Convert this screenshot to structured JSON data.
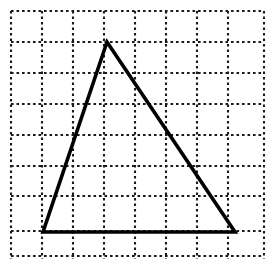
{
  "figure": {
    "title": "Triangle drawn on a dotted square grid",
    "background_color": "#ffffff",
    "width": 273,
    "height": 276
  },
  "chart_data": {
    "type": "scatter",
    "title": "Triangle drawn on a dotted square grid",
    "subtitle": "",
    "xlabel": "",
    "ylabel": "",
    "grid": true,
    "grid_style": "dotted",
    "legend": "none",
    "xlim": [
      0,
      8
    ],
    "ylim": [
      0,
      8
    ],
    "x_tick_labels": [],
    "y_tick_labels": [],
    "grid_columns": 8,
    "grid_rows": 8,
    "cell_width_px": 31,
    "cell_height_px": 30.7,
    "grid_origin_px": [
      11,
      11
    ],
    "grid_line_color": "#1a1a1a",
    "grid_dash_pattern": "2.6 2.9",
    "shape_color": "#000000",
    "shape_stroke_width_px": 3.6,
    "shapes": [
      {
        "name": "triangle",
        "closed": true,
        "vertices_grid": [
          {
            "label": "apex",
            "x": 3.1,
            "y": 7.0
          },
          {
            "label": "bottom-left",
            "x": 1.0,
            "y": 0.8
          },
          {
            "label": "bottom-right",
            "x": 7.2,
            "y": 0.8
          }
        ],
        "vertices_px": [
          {
            "label": "apex",
            "x": 107,
            "y": 42
          },
          {
            "label": "bottom-left",
            "x": 43,
            "y": 232
          },
          {
            "label": "bottom-right",
            "x": 235,
            "y": 232
          }
        ],
        "base_length_cells": 6.2,
        "height_cells": 6.2
      }
    ],
    "annotations": []
  },
  "grid": {
    "vertical_line_x_px": [
      11,
      42,
      73,
      104,
      135,
      166,
      197,
      228,
      264
    ],
    "horizontal_line_y_px": [
      11,
      42,
      73,
      104,
      135,
      166,
      196,
      231,
      256
    ],
    "vertical_extent_px": [
      11,
      263
    ],
    "horizontal_extent_px": [
      11,
      259
    ]
  }
}
